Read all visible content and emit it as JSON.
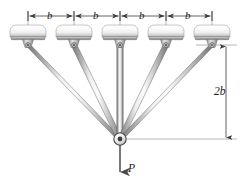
{
  "figure": {
    "background_color": "#ffffff",
    "line_color": "#3a3a3a",
    "bar_color_light": "#f2f2f2",
    "bar_color_mid": "#b8b8b8",
    "bar_color_dark": "#6e6e6e",
    "support_color_light": "#fafafa",
    "support_color_dark": "#9a9a9a"
  },
  "top_dimensions": {
    "count": 4,
    "labels": [
      "b",
      "b",
      "b",
      "b"
    ]
  },
  "vertical_dimension": {
    "label": "2b"
  },
  "load": {
    "label": "P",
    "direction": "down"
  },
  "supports": {
    "count": 5,
    "names": [
      "support-1",
      "support-2",
      "support-3",
      "support-4",
      "support-5"
    ]
  },
  "bars": {
    "count": 5,
    "names": [
      "bar-1",
      "bar-2",
      "bar-3",
      "bar-4",
      "bar-5"
    ]
  },
  "pin_joint": {
    "name": "central-pin-joint"
  }
}
